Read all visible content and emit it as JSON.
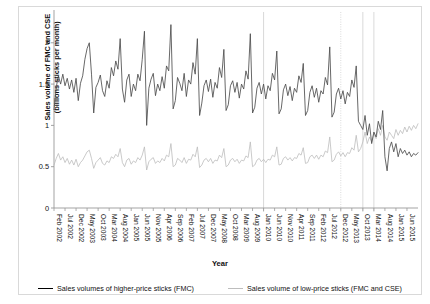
{
  "chart_data": {
    "type": "line",
    "title": "",
    "xlabel": "Year",
    "ylabel": "Sales volume of FMC and CSE\n(billions sticks per month)",
    "ylabel_line1": "Sales volume of FMC and CSE",
    "ylabel_line2": "(billions sticks per month)",
    "ylim": [
      0,
      2.3
    ],
    "yticks": [
      0,
      0.5,
      1,
      1.5,
      2
    ],
    "ytick_labels": [
      "0",
      "0.5",
      "1",
      "1.5",
      "2"
    ],
    "grid": false,
    "legend_position": "bottom",
    "x_tick_interval_months": 5,
    "x_start": "Feb 2002",
    "x_end": "Jun 2015",
    "xtick_labels": [
      "Feb 2002",
      "Jul 2002",
      "Dec 2002",
      "May 2003",
      "Oct 2003",
      "Mar 2004",
      "Aug 2004",
      "Jan 2005",
      "Jun 2005",
      "Nov 2005",
      "Apr 2006",
      "Sep 2006",
      "Feb 2007",
      "Jul 2007",
      "Dec 2007",
      "May 2008",
      "Oct 2008",
      "Mar 2009",
      "Aug 2009",
      "Jan 2010",
      "Jun 2010",
      "Nov 2010",
      "Apr 2011",
      "Sep 2011",
      "Feb 2012",
      "Jul 2012",
      "Dec 2012",
      "May 2013",
      "Oct 2013",
      "Mar 2014",
      "Aug 2014",
      "Jan 2015",
      "Jun 2015"
    ],
    "reference_lines": [
      {
        "label": "Jan 2010",
        "index": 95,
        "style": "solid"
      },
      {
        "label": "Dec 2012",
        "index": 130,
        "style": "dotted"
      },
      {
        "label": "Oct 2013",
        "index": 140,
        "style": "solid"
      },
      {
        "label": "Mar 2014",
        "index": 145,
        "style": "solid"
      }
    ],
    "series": [
      {
        "name": "Sales volumes of higher-price sticks (FMC)",
        "color": "#4d4d4d",
        "values": [
          1.19,
          1.46,
          1.6,
          1.5,
          1.62,
          1.48,
          1.57,
          1.44,
          1.55,
          1.4,
          1.57,
          1.3,
          1.51,
          1.6,
          1.8,
          1.93,
          2.0,
          1.62,
          1.15,
          1.46,
          1.52,
          1.61,
          1.42,
          1.35,
          1.54,
          1.45,
          1.7,
          1.6,
          1.78,
          1.68,
          2.05,
          1.44,
          1.28,
          1.55,
          1.62,
          1.35,
          1.5,
          1.42,
          1.62,
          1.54,
          1.8,
          2.14,
          1.0,
          1.45,
          1.56,
          1.63,
          1.36,
          1.5,
          1.42,
          1.59,
          1.45,
          1.72,
          1.66,
          2.22,
          1.2,
          1.3,
          1.58,
          1.51,
          1.42,
          1.63,
          1.35,
          1.55,
          1.5,
          1.76,
          1.62,
          2.05,
          1.12,
          1.27,
          1.48,
          1.55,
          1.41,
          1.56,
          1.34,
          1.52,
          1.45,
          1.7,
          1.58,
          1.92,
          1.18,
          1.25,
          1.48,
          1.54,
          1.4,
          1.52,
          1.33,
          1.5,
          1.44,
          1.66,
          1.56,
          2.11,
          1.15,
          1.22,
          1.45,
          1.52,
          1.38,
          1.5,
          1.32,
          1.48,
          1.42,
          1.63,
          1.55,
          1.9,
          1.14,
          1.2,
          1.43,
          1.5,
          1.36,
          1.47,
          1.3,
          1.45,
          1.4,
          1.6,
          1.52,
          1.75,
          1.12,
          1.18,
          1.4,
          1.48,
          1.34,
          1.45,
          1.28,
          1.42,
          1.38,
          1.58,
          1.49,
          1.95,
          1.1,
          1.16,
          1.38,
          1.45,
          1.32,
          1.42,
          1.26,
          1.4,
          1.35,
          1.55,
          1.46,
          1.72,
          1.05,
          1.0,
          0.95,
          1.12,
          0.88,
          1.02,
          0.78,
          0.92,
          0.86,
          1.05,
          0.95,
          1.18,
          0.62,
          0.45,
          0.72,
          0.8,
          0.68,
          0.78,
          0.62,
          0.72,
          0.66,
          0.7,
          0.64,
          0.68,
          0.62,
          0.66,
          0.64,
          0.67
        ]
      },
      {
        "name": "Sales volume of low-price sticks (FMC and CSE)",
        "color": "#bdbdbd",
        "values": [
          0.52,
          0.6,
          0.66,
          0.58,
          0.62,
          0.55,
          0.6,
          0.53,
          0.58,
          0.52,
          0.59,
          0.5,
          0.55,
          0.58,
          0.63,
          0.68,
          0.7,
          0.6,
          0.48,
          0.55,
          0.58,
          0.61,
          0.54,
          0.52,
          0.57,
          0.55,
          0.62,
          0.6,
          0.65,
          0.62,
          0.72,
          0.55,
          0.5,
          0.58,
          0.6,
          0.53,
          0.57,
          0.55,
          0.61,
          0.58,
          0.64,
          0.74,
          0.46,
          0.56,
          0.59,
          0.61,
          0.54,
          0.57,
          0.55,
          0.6,
          0.57,
          0.64,
          0.62,
          0.78,
          0.5,
          0.52,
          0.6,
          0.58,
          0.55,
          0.61,
          0.54,
          0.59,
          0.58,
          0.65,
          0.62,
          0.74,
          0.49,
          0.52,
          0.58,
          0.6,
          0.56,
          0.6,
          0.54,
          0.58,
          0.57,
          0.64,
          0.61,
          0.72,
          0.5,
          0.52,
          0.58,
          0.6,
          0.56,
          0.59,
          0.54,
          0.58,
          0.57,
          0.63,
          0.61,
          0.8,
          0.5,
          0.52,
          0.58,
          0.6,
          0.56,
          0.59,
          0.55,
          0.59,
          0.58,
          0.64,
          0.62,
          0.74,
          0.52,
          0.53,
          0.6,
          0.62,
          0.58,
          0.61,
          0.57,
          0.61,
          0.6,
          0.66,
          0.64,
          0.73,
          0.54,
          0.55,
          0.62,
          0.64,
          0.6,
          0.64,
          0.59,
          0.64,
          0.62,
          0.69,
          0.67,
          0.86,
          0.56,
          0.58,
          0.65,
          0.68,
          0.63,
          0.67,
          0.62,
          0.67,
          0.66,
          0.73,
          0.7,
          0.88,
          0.68,
          0.72,
          0.8,
          0.92,
          0.78,
          0.86,
          0.8,
          0.9,
          0.84,
          0.96,
          0.88,
          1.0,
          0.86,
          0.82,
          0.92,
          0.88,
          0.84,
          0.95,
          0.88,
          0.94,
          0.9,
          0.98,
          0.92,
          0.99,
          0.94,
          1.0,
          0.96,
          1.02
        ]
      }
    ]
  },
  "axis": {
    "y_title_line1": "Sales volume of FMC and CSE",
    "y_title_line2": "(billions sticks per month)",
    "x_title": "Year"
  },
  "legend": {
    "items": [
      {
        "label": "Sales volumes of higher-price sticks (FMC)",
        "color": "#4d4d4d"
      },
      {
        "label": "Sales volume of low-price sticks (FMC and CSE)",
        "color": "#bdbdbd"
      }
    ]
  }
}
